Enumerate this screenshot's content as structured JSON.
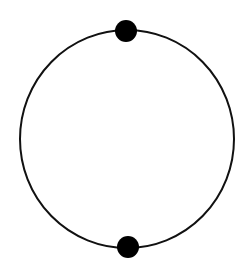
{
  "diagram": {
    "background": "#ffffff",
    "stroke_color": "#111111",
    "circle": {
      "cx": 127,
      "cy": 139,
      "rx": 107,
      "ry": 109,
      "stroke_width": 2
    },
    "nodes": [
      {
        "id": "top",
        "cx": 126,
        "cy": 31,
        "r": 11,
        "fill": "#000000"
      },
      {
        "id": "bottom",
        "cx": 128,
        "cy": 247,
        "r": 11,
        "fill": "#000000"
      }
    ]
  }
}
